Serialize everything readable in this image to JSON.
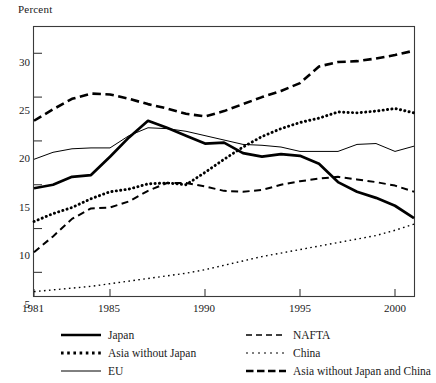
{
  "chart_data": {
    "type": "line",
    "title": "",
    "ylabel": "Percent",
    "xlabel": "",
    "xlim": [
      1981,
      2001
    ],
    "ylim": [
      2.3,
      33.0
    ],
    "yticks": [
      5,
      10,
      15,
      20,
      25,
      30
    ],
    "xticks": [
      1981,
      1985,
      1990,
      1995,
      2000
    ],
    "grid": false,
    "legend_position": "below-axes",
    "x": [
      1981,
      1982,
      1983,
      1984,
      1985,
      1986,
      1987,
      1988,
      1989,
      1990,
      1991,
      1992,
      1993,
      1994,
      1995,
      1996,
      1997,
      1998,
      1999,
      2000,
      2001
    ],
    "series": [
      {
        "name": "Japan",
        "style": "solid-thick",
        "values": [
          14.6,
          15.0,
          15.9,
          16.1,
          18.2,
          20.4,
          22.3,
          21.5,
          20.6,
          19.7,
          19.8,
          18.6,
          18.2,
          18.5,
          18.3,
          17.4,
          15.3,
          14.2,
          13.5,
          12.6,
          11.2
        ]
      },
      {
        "name": "Asia without Japan",
        "style": "dotted-thick",
        "values": [
          10.8,
          11.7,
          12.4,
          13.4,
          14.2,
          14.5,
          15.1,
          15.2,
          15.0,
          16.4,
          17.9,
          19.3,
          20.5,
          21.4,
          22.1,
          22.6,
          23.3,
          23.2,
          23.4,
          23.7,
          23.2
        ]
      },
      {
        "name": "EU",
        "style": "solid-thin",
        "values": [
          17.9,
          18.7,
          19.1,
          19.2,
          19.2,
          20.6,
          21.5,
          21.4,
          21.1,
          20.6,
          20.1,
          19.6,
          19.5,
          19.3,
          18.8,
          18.8,
          18.8,
          19.6,
          19.7,
          18.8,
          19.4
        ]
      },
      {
        "name": "NAFTA",
        "style": "dashed-medium",
        "values": [
          7.3,
          9.1,
          11.1,
          12.3,
          12.4,
          13.1,
          14.3,
          15.2,
          15.2,
          14.8,
          14.3,
          14.2,
          14.4,
          15.0,
          15.4,
          15.7,
          15.9,
          15.6,
          15.3,
          14.9,
          14.2
        ]
      },
      {
        "name": "China",
        "style": "dotted-fine",
        "values": [
          2.8,
          3.0,
          3.2,
          3.4,
          3.7,
          4.0,
          4.3,
          4.6,
          4.9,
          5.3,
          5.8,
          6.3,
          6.8,
          7.2,
          7.6,
          8.0,
          8.4,
          8.8,
          9.2,
          9.8,
          10.5
        ]
      },
      {
        "name": "Asia without Japan and China",
        "style": "dashed-thick",
        "values": [
          22.3,
          23.6,
          24.8,
          25.4,
          25.3,
          24.8,
          24.2,
          23.7,
          23.1,
          22.8,
          23.4,
          24.2,
          25.0,
          25.7,
          26.6,
          28.5,
          29.0,
          29.1,
          29.4,
          29.8,
          30.3
        ]
      }
    ]
  },
  "legend": {
    "left_column": [
      {
        "label": "Japan",
        "style": "solid-thick"
      },
      {
        "label": "Asia without Japan",
        "style": "dotted-thick"
      },
      {
        "label": "EU",
        "style": "solid-thin"
      }
    ],
    "right_column": [
      {
        "label": "NAFTA",
        "style": "dashed-medium"
      },
      {
        "label": "China",
        "style": "dotted-fine"
      },
      {
        "label": "Asia without Japan and China",
        "style": "dashed-thick"
      }
    ]
  },
  "axes": {
    "y_title": "Percent",
    "y_tick_labels": [
      "30",
      "25",
      "20",
      "15",
      "10",
      "5"
    ],
    "x_tick_labels": [
      "1981",
      "1985",
      "1990",
      "1995",
      "2000"
    ]
  },
  "colors": {
    "line": "#000000",
    "frame": "#3a3a3a",
    "background": "#ffffff"
  }
}
